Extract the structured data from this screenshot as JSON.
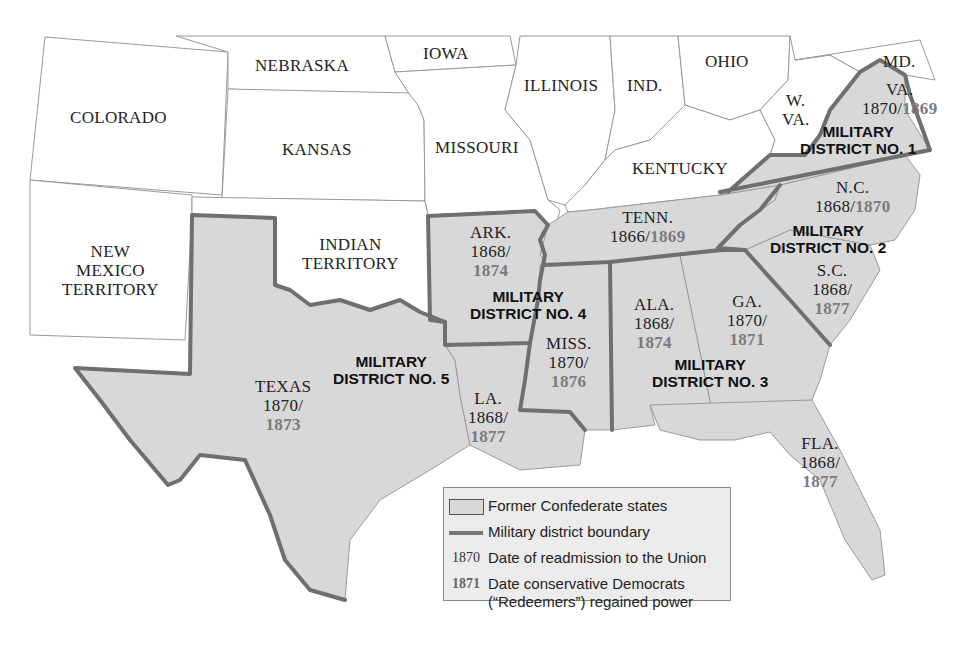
{
  "map": {
    "title": "Reconstruction Military Districts",
    "colors": {
      "confederate_fill": "#d8d8d8",
      "union_fill": "#ffffff",
      "district_boundary": "#6f6f6f",
      "redeemer_date": "#7a7a7a"
    },
    "non_confederate_states": [
      {
        "name": "COLORADO"
      },
      {
        "name": "NEBRASKA"
      },
      {
        "name": "IOWA"
      },
      {
        "name": "KANSAS"
      },
      {
        "name": "MISSOURI"
      },
      {
        "name": "ILLINOIS"
      },
      {
        "name": "IND."
      },
      {
        "name": "OHIO"
      },
      {
        "name": "KENTUCKY"
      },
      {
        "name": "W."
      },
      {
        "name": "VA."
      },
      {
        "name": "MD."
      },
      {
        "name_line1": "NEW",
        "name_line2": "MEXICO",
        "name_line3": "TERRITORY"
      },
      {
        "name_line1": "INDIAN",
        "name_line2": "TERRITORY"
      }
    ],
    "confederate_states": [
      {
        "abbr": "VA.",
        "readmitted": "1870/",
        "redeemed": "1869"
      },
      {
        "abbr": "N.C.",
        "readmitted": "1868/",
        "redeemed": "1870"
      },
      {
        "abbr": "S.C.",
        "readmitted": "1868/",
        "redeemed": "1877"
      },
      {
        "abbr": "GA.",
        "readmitted": "1870/",
        "redeemed": "1871"
      },
      {
        "abbr": "FLA.",
        "readmitted": "1868/",
        "redeemed": "1877"
      },
      {
        "abbr": "ALA.",
        "readmitted": "1868/",
        "redeemed": "1874"
      },
      {
        "abbr": "MISS.",
        "readmitted": "1870/",
        "redeemed": "1876"
      },
      {
        "abbr": "LA.",
        "readmitted": "1868/",
        "redeemed": "1877"
      },
      {
        "abbr": "ARK.",
        "readmitted": "1868/",
        "redeemed": "1874"
      },
      {
        "abbr": "TEXAS",
        "readmitted": "1870/",
        "redeemed": "1873"
      },
      {
        "abbr": "TENN.",
        "readmitted": "1866/",
        "redeemed": "1869"
      }
    ],
    "districts": [
      {
        "line1": "MILITARY",
        "line2": "DISTRICT NO. 1"
      },
      {
        "line1": "MILITARY",
        "line2": "DISTRICT NO. 2"
      },
      {
        "line1": "MILITARY",
        "line2": "DISTRICT NO. 3"
      },
      {
        "line1": "MILITARY",
        "line2": "DISTRICT NO. 4"
      },
      {
        "line1": "MILITARY",
        "line2": "DISTRICT NO. 5"
      }
    ]
  },
  "legend": {
    "items": [
      {
        "key": "",
        "text": "Former Confederate states"
      },
      {
        "key": "",
        "text": "Military district boundary"
      },
      {
        "key": "1870",
        "text": "Date of readmission to the Union"
      },
      {
        "key": "1871",
        "text_line1": "Date conservative Democrats",
        "text_line2": "(“Redeemers”) regained power"
      }
    ]
  }
}
